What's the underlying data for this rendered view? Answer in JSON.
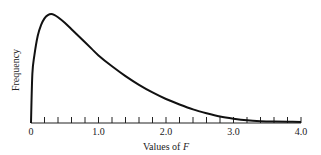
{
  "chart_data": {
    "type": "line",
    "title": "",
    "xlabel": "Values of F",
    "xlabel_prefix": "Values of ",
    "xlabel_var": "F",
    "ylabel": "Frequency",
    "xlim": [
      0,
      4.0
    ],
    "x_tick_labels": [
      "0",
      "1.0",
      "2.0",
      "3.0",
      "4.0"
    ],
    "x_tick_values": [
      0,
      1.0,
      2.0,
      3.0,
      4.0
    ],
    "minor_tick_step": 0.2,
    "grid": false,
    "legend": null,
    "series": [
      {
        "name": "F distribution density",
        "x": [
          0,
          0.02,
          0.05,
          0.1,
          0.15,
          0.2,
          0.25,
          0.3,
          0.35,
          0.4,
          0.5,
          0.6,
          0.7,
          0.8,
          0.9,
          1.0,
          1.2,
          1.4,
          1.6,
          1.8,
          2.0,
          2.2,
          2.4,
          2.6,
          2.8,
          3.0,
          3.2,
          3.4,
          3.6,
          3.8,
          4.0
        ],
        "y": [
          0,
          0.45,
          0.62,
          0.8,
          0.9,
          0.96,
          0.99,
          1.0,
          0.99,
          0.97,
          0.92,
          0.86,
          0.8,
          0.74,
          0.68,
          0.62,
          0.52,
          0.43,
          0.35,
          0.28,
          0.22,
          0.17,
          0.125,
          0.09,
          0.06,
          0.04,
          0.025,
          0.017,
          0.013,
          0.011,
          0.01
        ]
      }
    ]
  }
}
